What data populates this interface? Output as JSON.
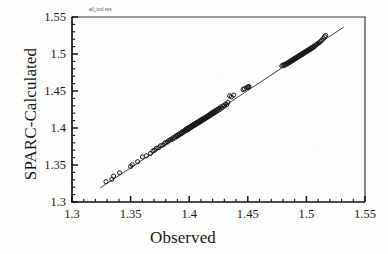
{
  "header_note": "all_incl.res",
  "chart_data": {
    "type": "scatter",
    "title": "",
    "xlabel": "Observed",
    "ylabel": "SPARC-Calculated",
    "xlim": [
      1.3,
      1.55
    ],
    "ylim": [
      1.3,
      1.55
    ],
    "xticks": [
      "1.3",
      "1.35",
      "1.4",
      "1.45",
      "1.5",
      "1.55"
    ],
    "yticks": [
      "1.3",
      "1.35",
      "1.4",
      "1.45",
      "1.5",
      "1.55"
    ],
    "xtick_values": [
      1.3,
      1.35,
      1.4,
      1.45,
      1.5,
      1.55
    ],
    "ytick_values": [
      1.3,
      1.35,
      1.4,
      1.45,
      1.5,
      1.55
    ],
    "minor_ticks_per_interval": 5,
    "grid": false,
    "legend": "none",
    "marker": "open-circle",
    "marker_color": "#1a1a1a",
    "marker_fill": "none",
    "line_color": "#2a2a2a",
    "fit_line": {
      "label": "identity-line",
      "x_start": 1.3245,
      "y_start": 1.3195,
      "x_end": 1.5315,
      "y_end": 1.536
    },
    "series": [
      {
        "name": "SPARC vs Observed refractive index",
        "points": [
          [
            1.329,
            1.3275
          ],
          [
            1.334,
            1.3305
          ],
          [
            1.3355,
            1.335
          ],
          [
            1.3405,
            1.3395
          ],
          [
            1.35,
            1.348
          ],
          [
            1.3515,
            1.3505
          ],
          [
            1.356,
            1.3545
          ],
          [
            1.36,
            1.361
          ],
          [
            1.3635,
            1.3625
          ],
          [
            1.367,
            1.3655
          ],
          [
            1.369,
            1.369
          ],
          [
            1.3705,
            1.37
          ],
          [
            1.372,
            1.3725
          ],
          [
            1.374,
            1.3735
          ],
          [
            1.3755,
            1.376
          ],
          [
            1.3775,
            1.377
          ],
          [
            1.379,
            1.379
          ],
          [
            1.38,
            1.3805
          ],
          [
            1.3815,
            1.381
          ],
          [
            1.3825,
            1.383
          ],
          [
            1.3835,
            1.3835
          ],
          [
            1.3845,
            1.385
          ],
          [
            1.3855,
            1.3845
          ],
          [
            1.3865,
            1.387
          ],
          [
            1.3875,
            1.3865
          ],
          [
            1.3885,
            1.389
          ],
          [
            1.389,
            1.388
          ],
          [
            1.39,
            1.3905
          ],
          [
            1.3905,
            1.3895
          ],
          [
            1.3915,
            1.392
          ],
          [
            1.392,
            1.391
          ],
          [
            1.393,
            1.3935
          ],
          [
            1.3935,
            1.3925
          ],
          [
            1.394,
            1.395
          ],
          [
            1.395,
            1.394
          ],
          [
            1.3955,
            1.396
          ],
          [
            1.396,
            1.3955
          ],
          [
            1.3965,
            1.3975
          ],
          [
            1.397,
            1.3965
          ],
          [
            1.3975,
            1.3985
          ],
          [
            1.398,
            1.397
          ],
          [
            1.3985,
            1.3995
          ],
          [
            1.399,
            1.398
          ],
          [
            1.3995,
            1.4005
          ],
          [
            1.4,
            1.399
          ],
          [
            1.4,
            1.401
          ],
          [
            1.4005,
            1.4
          ],
          [
            1.401,
            1.402
          ],
          [
            1.4015,
            1.4005
          ],
          [
            1.402,
            1.403
          ],
          [
            1.402,
            1.4015
          ],
          [
            1.4025,
            1.4035
          ],
          [
            1.403,
            1.4025
          ],
          [
            1.4035,
            1.4045
          ],
          [
            1.404,
            1.403
          ],
          [
            1.4045,
            1.405
          ],
          [
            1.4045,
            1.404
          ],
          [
            1.405,
            1.406
          ],
          [
            1.4055,
            1.4045
          ],
          [
            1.406,
            1.4065
          ],
          [
            1.406,
            1.4055
          ],
          [
            1.4065,
            1.4075
          ],
          [
            1.407,
            1.406
          ],
          [
            1.4075,
            1.408
          ],
          [
            1.408,
            1.407
          ],
          [
            1.4085,
            1.409
          ],
          [
            1.4085,
            1.408
          ],
          [
            1.409,
            1.41
          ],
          [
            1.4095,
            1.4085
          ],
          [
            1.41,
            1.4105
          ],
          [
            1.4105,
            1.4095
          ],
          [
            1.411,
            1.4115
          ],
          [
            1.411,
            1.4105
          ],
          [
            1.4115,
            1.4125
          ],
          [
            1.412,
            1.411
          ],
          [
            1.4125,
            1.413
          ],
          [
            1.413,
            1.412
          ],
          [
            1.4135,
            1.414
          ],
          [
            1.414,
            1.413
          ],
          [
            1.4145,
            1.415
          ],
          [
            1.415,
            1.414
          ],
          [
            1.4155,
            1.416
          ],
          [
            1.416,
            1.415
          ],
          [
            1.4165,
            1.417
          ],
          [
            1.417,
            1.416
          ],
          [
            1.4175,
            1.418
          ],
          [
            1.418,
            1.417
          ],
          [
            1.4185,
            1.4195
          ],
          [
            1.419,
            1.4185
          ],
          [
            1.4195,
            1.4205
          ],
          [
            1.42,
            1.419
          ],
          [
            1.4205,
            1.4215
          ],
          [
            1.421,
            1.42
          ],
          [
            1.4215,
            1.4225
          ],
          [
            1.422,
            1.421
          ],
          [
            1.4225,
            1.4235
          ],
          [
            1.423,
            1.422
          ],
          [
            1.424,
            1.425
          ],
          [
            1.4245,
            1.4235
          ],
          [
            1.4255,
            1.4265
          ],
          [
            1.426,
            1.425
          ],
          [
            1.427,
            1.4285
          ],
          [
            1.428,
            1.427
          ],
          [
            1.429,
            1.43
          ],
          [
            1.43,
            1.4295
          ],
          [
            1.431,
            1.4325
          ],
          [
            1.432,
            1.4315
          ],
          [
            1.433,
            1.4345
          ],
          [
            1.4345,
            1.4435
          ],
          [
            1.436,
            1.442
          ],
          [
            1.438,
            1.4445
          ],
          [
            1.446,
            1.452
          ],
          [
            1.447,
            1.453
          ],
          [
            1.449,
            1.4545
          ],
          [
            1.45,
            1.4555
          ],
          [
            1.4505,
            1.455
          ],
          [
            1.451,
            1.456
          ],
          [
            1.479,
            1.484
          ],
          [
            1.48,
            1.485
          ],
          [
            1.481,
            1.4845
          ],
          [
            1.4815,
            1.486
          ],
          [
            1.482,
            1.4855
          ],
          [
            1.483,
            1.487
          ],
          [
            1.4835,
            1.4865
          ],
          [
            1.484,
            1.488
          ],
          [
            1.4845,
            1.4875
          ],
          [
            1.485,
            1.489
          ],
          [
            1.4855,
            1.4885
          ],
          [
            1.486,
            1.49
          ],
          [
            1.4865,
            1.4895
          ],
          [
            1.487,
            1.491
          ],
          [
            1.4875,
            1.4905
          ],
          [
            1.488,
            1.492
          ],
          [
            1.4885,
            1.4915
          ],
          [
            1.489,
            1.493
          ],
          [
            1.4895,
            1.4925
          ],
          [
            1.49,
            1.494
          ],
          [
            1.4905,
            1.4935
          ],
          [
            1.491,
            1.495
          ],
          [
            1.4915,
            1.4945
          ],
          [
            1.492,
            1.496
          ],
          [
            1.4925,
            1.4955
          ],
          [
            1.493,
            1.497
          ],
          [
            1.4935,
            1.4965
          ],
          [
            1.494,
            1.498
          ],
          [
            1.4945,
            1.4975
          ],
          [
            1.495,
            1.499
          ],
          [
            1.4955,
            1.4985
          ],
          [
            1.496,
            1.5
          ],
          [
            1.4965,
            1.4995
          ],
          [
            1.497,
            1.501
          ],
          [
            1.4975,
            1.5005
          ],
          [
            1.498,
            1.502
          ],
          [
            1.4985,
            1.5015
          ],
          [
            1.499,
            1.503
          ],
          [
            1.4995,
            1.5025
          ],
          [
            1.5,
            1.504
          ],
          [
            1.5005,
            1.5035
          ],
          [
            1.501,
            1.505
          ],
          [
            1.5015,
            1.5045
          ],
          [
            1.502,
            1.506
          ],
          [
            1.5025,
            1.5055
          ],
          [
            1.503,
            1.507
          ],
          [
            1.5035,
            1.5065
          ],
          [
            1.504,
            1.508
          ],
          [
            1.5045,
            1.5075
          ],
          [
            1.505,
            1.509
          ],
          [
            1.5055,
            1.5085
          ],
          [
            1.506,
            1.51
          ],
          [
            1.5065,
            1.5095
          ],
          [
            1.507,
            1.511
          ],
          [
            1.508,
            1.512
          ],
          [
            1.509,
            1.513
          ],
          [
            1.51,
            1.5145
          ],
          [
            1.511,
            1.5155
          ],
          [
            1.512,
            1.517
          ],
          [
            1.513,
            1.5185
          ],
          [
            1.5145,
            1.521
          ],
          [
            1.5155,
            1.5235
          ],
          [
            1.5165,
            1.525
          ]
        ]
      }
    ]
  }
}
